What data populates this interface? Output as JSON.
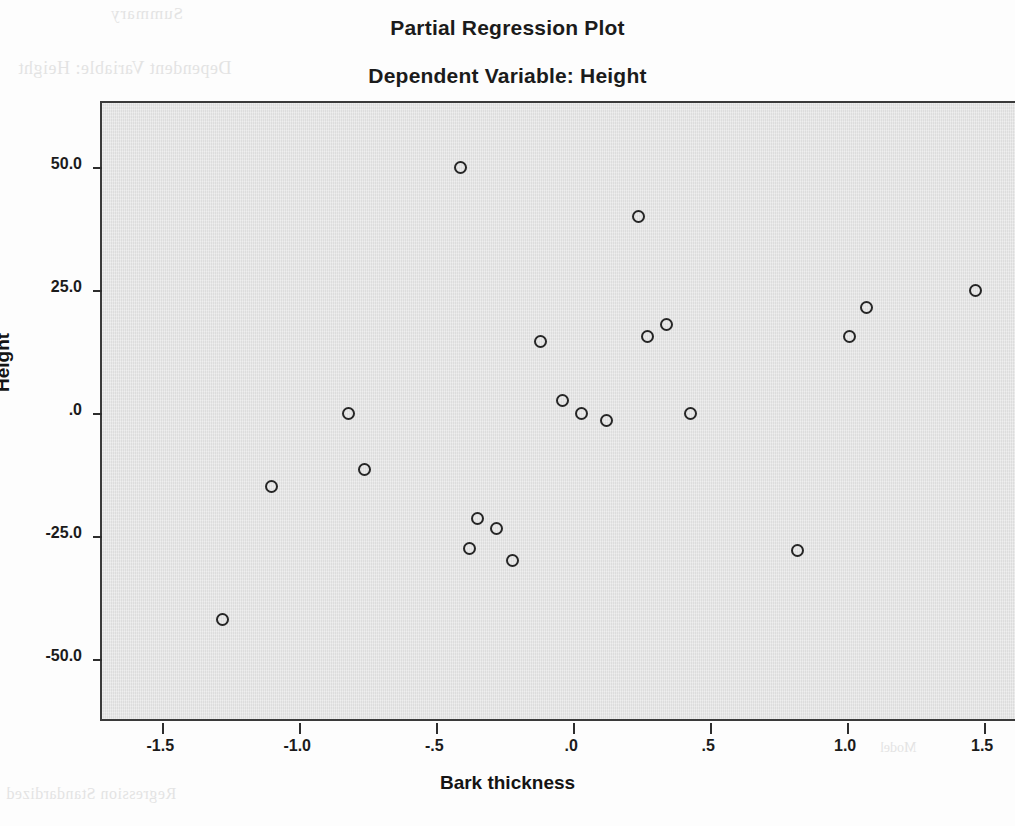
{
  "titles": {
    "main": "Partial Regression Plot",
    "sub": "Dependent Variable: Height"
  },
  "background_bleed": {
    "line_a": "Summary",
    "line_b": "Dependent Variable: Height",
    "line_c": "Regression Standardized",
    "line_d": "Model"
  },
  "chart_data": {
    "type": "scatter",
    "title": "Partial Regression Plot",
    "subtitle": "Dependent Variable: Height",
    "xlabel": "Bark thickness",
    "ylabel": "Height",
    "xlim": [
      -1.72,
      1.62
    ],
    "ylim": [
      -63.0,
      63.0
    ],
    "grid": false,
    "legend": null,
    "marker": "open-circle",
    "marker_color": "#262626",
    "panel_color": "#e2e2e2",
    "xticks": [
      -1.5,
      -1.0,
      -0.5,
      0.0,
      0.5,
      1.0,
      1.5
    ],
    "xtick_labels": [
      "-1.5",
      "-1.0",
      "-.5",
      ".0",
      ".5",
      "1.0",
      "1.5"
    ],
    "yticks": [
      50.0,
      25.0,
      0.0,
      -25.0,
      -50.0
    ],
    "ytick_labels": [
      "50.0",
      "25.0",
      ".0",
      "-25.0",
      "-50.0"
    ],
    "n_points": 23,
    "points": [
      {
        "x": -1.28,
        "y": -42.0
      },
      {
        "x": -1.1,
        "y": -15.0
      },
      {
        "x": -0.82,
        "y": 0.0
      },
      {
        "x": -0.76,
        "y": -11.5
      },
      {
        "x": -0.41,
        "y": 49.8
      },
      {
        "x": -0.38,
        "y": -27.5
      },
      {
        "x": -0.35,
        "y": -21.5
      },
      {
        "x": -0.28,
        "y": -23.5
      },
      {
        "x": -0.22,
        "y": -30.0
      },
      {
        "x": -0.12,
        "y": 14.5
      },
      {
        "x": -0.04,
        "y": 2.5
      },
      {
        "x": 0.03,
        "y": 0.0
      },
      {
        "x": 0.12,
        "y": -1.5
      },
      {
        "x": 0.24,
        "y": 40.0
      },
      {
        "x": 0.27,
        "y": 15.5
      },
      {
        "x": 0.34,
        "y": 18.0
      },
      {
        "x": 0.43,
        "y": 0.0
      },
      {
        "x": 0.82,
        "y": -28.0
      },
      {
        "x": 1.01,
        "y": 15.5
      },
      {
        "x": 1.07,
        "y": 21.5
      },
      {
        "x": 1.47,
        "y": 24.9
      }
    ]
  }
}
